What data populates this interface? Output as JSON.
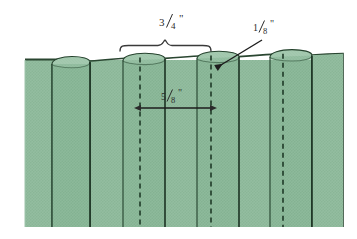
{
  "figure": {
    "background_color": "#ffffff"
  },
  "colors": {
    "fabric_fill": "#8fba9c",
    "fabric_fill_shade": "#7fae8f",
    "fabric_top_ellipse": "#a9cbb3",
    "fold_line": "#24402c",
    "outline": "#1c3323",
    "annotation": "#2b2b2b",
    "dashed_stitch": "#1f3a27"
  },
  "dimensions": [
    {
      "id": "pleat-width",
      "name": "pleat-width-dimension",
      "numerator": "3",
      "denominator": "4",
      "unit": "\"",
      "label": "3/4\"",
      "marker": "brace",
      "position": "top-center"
    },
    {
      "id": "fold-depth",
      "name": "fold-depth-dimension",
      "numerator": "1",
      "denominator": "8",
      "unit": "\"",
      "label": "1/8\"",
      "marker": "leader-arrow",
      "position": "top-right"
    },
    {
      "id": "stitch-spacing",
      "name": "stitch-spacing-dimension",
      "numerator": "5",
      "denominator": "8",
      "unit": "\"",
      "label": "5/8\"",
      "marker": "double-arrow",
      "position": "middle-center"
    }
  ],
  "geometry": {
    "fabric_left": 25,
    "fabric_right": 343,
    "fabric_top": 59,
    "fabric_bottom": 227,
    "pleat_folds": [
      84,
      158,
      232,
      306
    ],
    "stitch_lines": [
      140,
      211,
      283
    ],
    "brace_left": 120,
    "brace_right": 211,
    "brace_peak": 165,
    "brace_y": 44,
    "arrow_y": 108,
    "arrow_left": 140,
    "arrow_right": 211,
    "leader_start_x": 262,
    "leader_start_y": 40,
    "leader_end_x": 215,
    "leader_end_y": 69
  }
}
